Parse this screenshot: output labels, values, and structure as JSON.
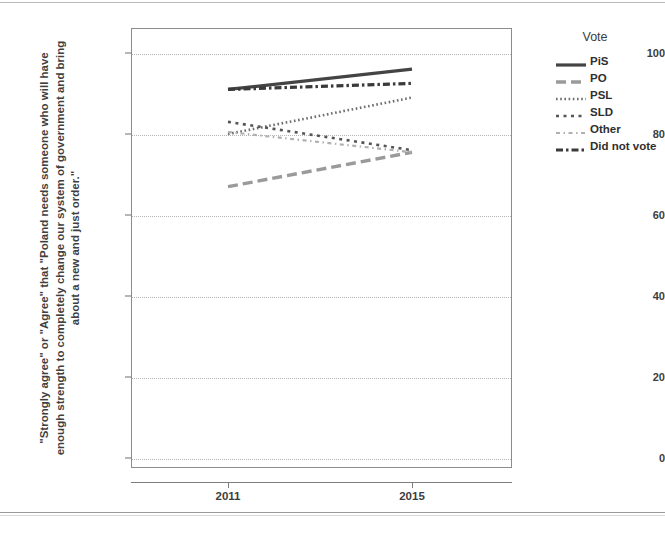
{
  "chart_data": {
    "type": "line",
    "title": "",
    "xlabel": "",
    "ylabel": "\"Strongly agree\" or \"Agree\" that \"Poland needs someone who will have enough strength to completely change our system of government and bring about a new and just order.\"",
    "x": [
      "2011",
      "2015"
    ],
    "xtick_labels": [
      "2011",
      "2015"
    ],
    "ytick_labels": [
      "0",
      "20",
      "40",
      "60",
      "80",
      "100"
    ],
    "ytick_values": [
      0,
      20,
      40,
      60,
      80,
      100
    ],
    "ylim": [
      0,
      100
    ],
    "grid": "horizontal-dotted",
    "legend_position": "right",
    "legend_title": "Vote",
    "series": [
      {
        "name": "PiS",
        "values": [
          91,
          96
        ],
        "linestyle": "solid",
        "color": "#444444",
        "width": 3.2
      },
      {
        "name": "PO",
        "values": [
          67,
          75.5
        ],
        "linestyle": "long-dash",
        "color": "#9a9a9a",
        "width": 3.4
      },
      {
        "name": "PSL",
        "values": [
          80,
          89
        ],
        "linestyle": "fine-dotted",
        "color": "#6d6d6d",
        "width": 2.6
      },
      {
        "name": "SLD",
        "values": [
          83,
          76
        ],
        "linestyle": "square-dot",
        "color": "#555555",
        "width": 2.6
      },
      {
        "name": "Other",
        "values": [
          80.5,
          75.5
        ],
        "linestyle": "light-dash-dot",
        "color": "#b0b0b0",
        "width": 2.2
      },
      {
        "name": "Did not vote",
        "values": [
          91,
          92.5
        ],
        "linestyle": "dash-dot-heavy",
        "color": "#3a3a3a",
        "width": 3.2
      }
    ]
  },
  "legend": {
    "title": "Vote",
    "items": [
      {
        "label": "PiS"
      },
      {
        "label": "PO"
      },
      {
        "label": "PSL"
      },
      {
        "label": "SLD"
      },
      {
        "label": "Other"
      },
      {
        "label": "Did not vote"
      }
    ]
  },
  "axes": {
    "y": {
      "ticks": [
        {
          "label": "100"
        },
        {
          "label": "80"
        },
        {
          "label": "60"
        },
        {
          "label": "40"
        },
        {
          "label": "20"
        },
        {
          "label": "0"
        }
      ],
      "title": "\"Strongly agree\" or \"Agree\" that \"Poland needs someone who will have enough strength to completely change our system of government and bring about a new and just order.\""
    },
    "x": {
      "ticks": [
        {
          "label": "2011"
        },
        {
          "label": "2015"
        }
      ]
    }
  }
}
